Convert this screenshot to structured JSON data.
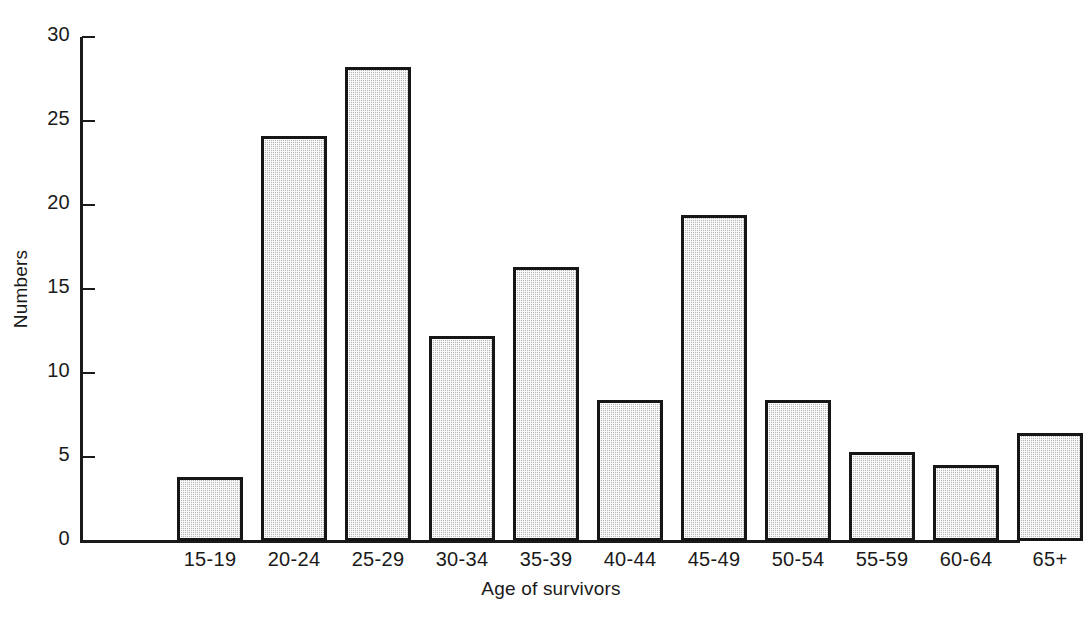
{
  "chart_data": {
    "type": "bar",
    "title": "",
    "xlabel": "Age of survivors",
    "ylabel": "Numbers",
    "categories": [
      "15-19",
      "20-24",
      "25-29",
      "30-34",
      "35-39",
      "40-44",
      "45-49",
      "50-54",
      "55-59",
      "60-64",
      "65+"
    ],
    "values": [
      3.8,
      24.1,
      28.2,
      12.2,
      16.3,
      8.4,
      19.4,
      8.4,
      5.3,
      4.5,
      6.4
    ],
    "ylim": [
      0,
      30
    ],
    "yticks": [
      0,
      5,
      10,
      15,
      20,
      25,
      30
    ],
    "ytick_labels": [
      "0",
      "5",
      "10",
      "15",
      "20",
      "25",
      "30"
    ],
    "grid": false,
    "legend": null,
    "bar_fill_color": "#b9b9b9",
    "bar_edge_color": "#161616",
    "background_color": "#ffffff"
  }
}
